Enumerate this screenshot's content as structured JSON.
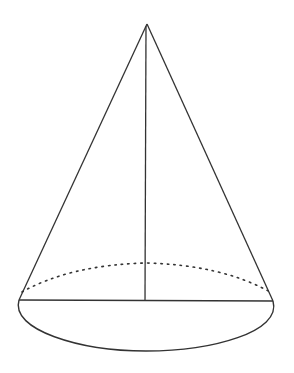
{
  "diagram": {
    "type": "cone",
    "colors": {
      "background": "#ffffff",
      "stroke": "#333333"
    },
    "apex": {
      "x": 147,
      "y": 24
    },
    "base_left": {
      "x": 19,
      "y": 300
    },
    "base_right": {
      "x": 273,
      "y": 301
    },
    "base_center": {
      "x": 145,
      "y": 300
    },
    "base_ellipse": {
      "rx": 127,
      "ry_front": 51,
      "ry_back": 37
    },
    "labels": []
  }
}
